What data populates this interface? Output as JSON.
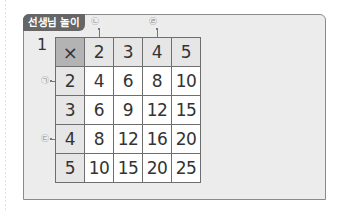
{
  "section_badge": "선생님 놀이",
  "problem": {
    "number": "1",
    "table": {
      "corner_symbol": "×",
      "column_headers": [
        "2",
        "3",
        "4",
        "5"
      ],
      "rows": [
        {
          "header": "2",
          "values": [
            "4",
            "6",
            "8",
            "10"
          ]
        },
        {
          "header": "3",
          "values": [
            "6",
            "9",
            "12",
            "15"
          ]
        },
        {
          "header": "4",
          "values": [
            "8",
            "12",
            "16",
            "20"
          ]
        },
        {
          "header": "5",
          "values": [
            "10",
            "15",
            "20",
            "25"
          ]
        }
      ]
    },
    "markers": {
      "row_2": "㉠",
      "col_2": "㉡",
      "row_4": "㉢",
      "col_4": "㉣"
    }
  },
  "colors": {
    "badge": "#666666",
    "panel": "#ececec",
    "corner_cell": "#b3b3b3",
    "header_cell": "#e6e6e6",
    "grid_line": "#6e6e6e"
  }
}
